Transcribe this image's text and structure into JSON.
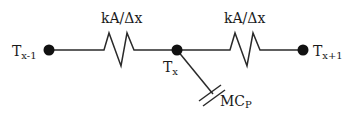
{
  "diagram": {
    "type": "thermal-resistance-capacitance network",
    "nodes": [
      {
        "id": "left",
        "label": "T",
        "sub": "x-1",
        "cx": 49,
        "cy": 50
      },
      {
        "id": "center",
        "label": "T",
        "sub": "x",
        "cx": 177,
        "cy": 50
      },
      {
        "id": "right",
        "label": "T",
        "sub": "x+1",
        "cx": 303,
        "cy": 50
      }
    ],
    "resistors": [
      {
        "id": "r1",
        "label": "kA/Δx",
        "from": "left",
        "to": "center"
      },
      {
        "id": "r2",
        "label": "kA/Δx",
        "from": "center",
        "to": "right"
      }
    ],
    "capacitor": {
      "label": "MC",
      "sub": "P",
      "from": "center"
    },
    "colors": {
      "line": "#2a2a2a",
      "node": "#111111",
      "text": "#1a1a1a",
      "background": "#ffffff"
    }
  }
}
